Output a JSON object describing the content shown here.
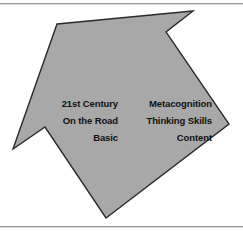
{
  "figure": {
    "shape_name": "arrow-polygon",
    "fill_color": "#a8a8a8",
    "stroke_color": "#2b2b2b",
    "background_color": "#ffffff",
    "rule_color": "#9a9a9a",
    "points": "57,24 193,11 166,32 229,124 106,218 45,127 13,149"
  },
  "labels": {
    "left_column": {
      "name": "left-label-group",
      "lines": [
        "21st Century",
        "On the Road",
        "Basic"
      ]
    },
    "right_column": {
      "name": "right-label-group",
      "lines": [
        "Metacognition",
        "Thinking Skills",
        "Content"
      ]
    }
  }
}
